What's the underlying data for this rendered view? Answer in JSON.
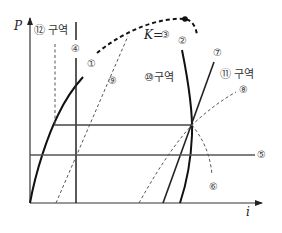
{
  "diagram": {
    "type": "P-i (pressure-enthalpy) diagram",
    "axes": {
      "y_label": "P",
      "x_label": "i"
    },
    "critical_point": {
      "label": "K=",
      "ref": "③"
    },
    "curve_labels": {
      "c1": "①",
      "c2": "②",
      "c4": "④",
      "c5": "⑤",
      "c6": "⑥",
      "c7": "⑦",
      "c8": "⑧",
      "c9": "⑨"
    },
    "regions": {
      "r10": "⑩구역",
      "r11": "⑪ 구역",
      "r12": "⑫ 구역"
    },
    "colors": {
      "solid": "#1a1a1a",
      "thin": "#555555",
      "dashed": "#666666"
    }
  }
}
